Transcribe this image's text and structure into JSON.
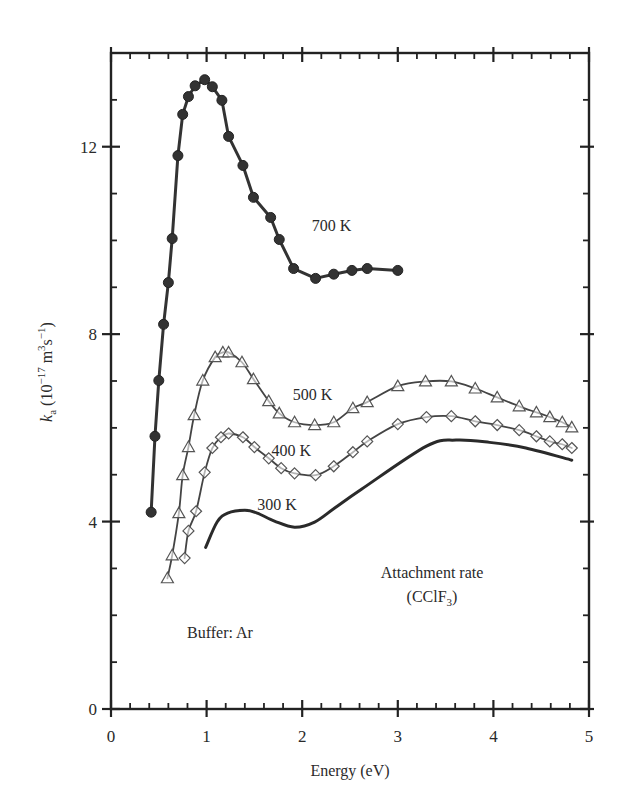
{
  "chart_data": {
    "type": "line",
    "title": "",
    "xlabel": "Energy (eV)",
    "ylabel": {
      "symbol": "k",
      "subscript": "a",
      "units_prefix": " (10",
      "exp": "−17",
      "units_mid": " m",
      "exp2": "3",
      "units_mid2": "s",
      "exp3": "−1",
      "units_suffix": ")"
    },
    "ylabel_plain": "k_a (10^-17 m^3 s^-1)",
    "xlim": [
      0,
      5
    ],
    "ylim": [
      0,
      14
    ],
    "x_ticks": [
      0,
      1,
      2,
      3,
      4,
      5
    ],
    "x_tick_labels": [
      "0",
      "1",
      "2",
      "3",
      "4",
      "5"
    ],
    "x_minor_step": 0.2,
    "y_ticks": [
      0,
      4,
      8,
      12
    ],
    "y_tick_labels": [
      "0",
      "4",
      "8",
      "12"
    ],
    "y_minor_step": 1,
    "grid": false,
    "legend": null,
    "series": [
      {
        "name": "700 K",
        "marker": "filled-circle",
        "color": "#333333",
        "label_pos": [
          2.1,
          10.2
        ],
        "x": [
          0.42,
          0.46,
          0.5,
          0.55,
          0.6,
          0.64,
          0.7,
          0.75,
          0.81,
          0.88,
          0.98,
          1.06,
          1.16,
          1.23,
          1.38,
          1.49,
          1.67,
          1.76,
          1.91,
          2.14,
          2.33,
          2.52,
          2.68,
          3.0
        ],
        "y": [
          4.2,
          5.82,
          7.01,
          8.21,
          9.1,
          10.04,
          11.81,
          12.69,
          13.07,
          13.3,
          13.43,
          13.28,
          12.99,
          12.22,
          11.6,
          10.92,
          10.49,
          10.02,
          9.4,
          9.19,
          9.28,
          9.36,
          9.4,
          9.36
        ]
      },
      {
        "name": "500 K",
        "marker": "open-triangle",
        "color": "#444444",
        "label_pos": [
          1.9,
          6.6
        ],
        "x": [
          0.59,
          0.64,
          0.71,
          0.75,
          0.81,
          0.87,
          0.96,
          1.09,
          1.17,
          1.23,
          1.37,
          1.49,
          1.65,
          1.76,
          1.92,
          2.13,
          2.33,
          2.53,
          2.68,
          3.0,
          3.29,
          3.56,
          3.81,
          4.04,
          4.27,
          4.45,
          4.59,
          4.72,
          4.82
        ],
        "y": [
          2.79,
          3.28,
          4.18,
          4.99,
          5.59,
          6.27,
          7.01,
          7.51,
          7.61,
          7.61,
          7.4,
          7.04,
          6.57,
          6.31,
          6.12,
          6.06,
          6.12,
          6.42,
          6.55,
          6.89,
          6.99,
          6.99,
          6.84,
          6.65,
          6.46,
          6.33,
          6.23,
          6.12,
          6.01
        ]
      },
      {
        "name": "400 K",
        "marker": "open-diamond",
        "color": "#444444",
        "label_pos": [
          1.68,
          5.4
        ],
        "x": [
          0.77,
          0.81,
          0.89,
          0.98,
          1.06,
          1.15,
          1.23,
          1.38,
          1.5,
          1.65,
          1.78,
          1.92,
          2.14,
          2.33,
          2.53,
          2.68,
          3.0,
          3.3,
          3.56,
          3.81,
          4.04,
          4.27,
          4.45,
          4.59,
          4.72,
          4.82
        ],
        "y": [
          3.22,
          3.8,
          4.22,
          5.05,
          5.57,
          5.8,
          5.88,
          5.8,
          5.59,
          5.35,
          5.14,
          5.03,
          4.99,
          5.18,
          5.48,
          5.71,
          6.08,
          6.23,
          6.25,
          6.14,
          6.06,
          5.95,
          5.82,
          5.71,
          5.65,
          5.57
        ]
      },
      {
        "name": "300 K",
        "marker": "none",
        "color": "#2a2a2a",
        "label_pos": [
          1.53,
          4.25
        ],
        "x": [
          0.99,
          1.11,
          1.22,
          1.4,
          1.53,
          1.71,
          1.92,
          2.13,
          2.34,
          2.62,
          3.3,
          3.61,
          3.96,
          4.34,
          4.82
        ],
        "y": [
          3.45,
          3.99,
          4.18,
          4.24,
          4.18,
          4.01,
          3.88,
          3.99,
          4.29,
          4.69,
          5.61,
          5.74,
          5.69,
          5.57,
          5.31
        ]
      }
    ],
    "annotations": [
      {
        "text": "Attachment rate",
        "x": 3.75,
        "y": 2.8
      },
      {
        "text_main": "(CClF",
        "text_sub": "3",
        "text_end": ")",
        "x": 3.75,
        "y": 2.25
      },
      {
        "text": "Buffer: Ar",
        "x": 1.15,
        "y": 1.6
      }
    ]
  },
  "labels": {
    "x_axis_title": "Energy (eV)",
    "y_axis_symbol": "k",
    "y_axis_sub": "a",
    "annotation_line1": "Attachment rate",
    "annotation_line2_main": "(CClF",
    "annotation_line2_sub": "3",
    "annotation_line2_end": ")",
    "buffer_label": "Buffer: Ar",
    "series_700": "700 K",
    "series_500": "500 K",
    "series_400": "400 K",
    "series_300": "300 K"
  }
}
